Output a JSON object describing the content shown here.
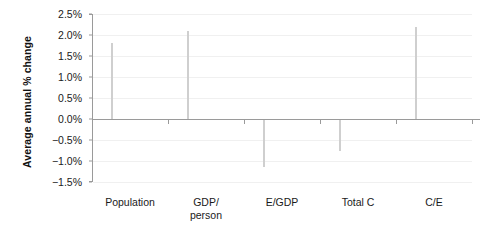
{
  "chart_data": {
    "type": "bar",
    "title": "",
    "xlabel": "",
    "ylabel": "Average annual % change",
    "categories": [
      "Population",
      "GDP/\nperson",
      "E/GDP",
      "Total C",
      "C/E"
    ],
    "category_lines": [
      [
        "Population"
      ],
      [
        "GDP/",
        "person"
      ],
      [
        "E/GDP"
      ],
      [
        "Total C"
      ],
      [
        "C/E"
      ]
    ],
    "values": [
      1.8,
      2.1,
      -1.15,
      -0.75,
      2.2
    ],
    "value_unit": "%",
    "ylim": [
      -1.5,
      2.5
    ],
    "ytick_values": [
      2.5,
      2.0,
      1.5,
      1.0,
      0.5,
      0.0,
      -0.5,
      -1.0,
      -1.5
    ],
    "ytick_labels": [
      "2.5%",
      "2.0%",
      "1.5%",
      "1.0%",
      "0.5%",
      "0.0%",
      "−0.5%",
      "−1.0%",
      "−1.5%"
    ],
    "grid": true,
    "legend": false,
    "colors": {
      "bar_fill": "#b5b5b5",
      "bar_border": "#cfcfcf",
      "axis": "#9a9a9a",
      "gridline": "#f0f0f0",
      "text": "#1a1a1a",
      "background": "#ffffff"
    }
  }
}
